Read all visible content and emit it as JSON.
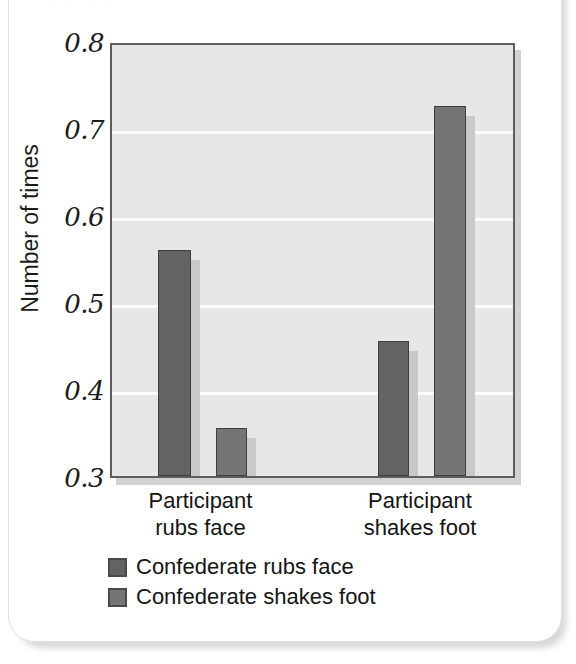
{
  "card": {
    "top_specks": "· · · ·"
  },
  "chart_data": {
    "type": "bar",
    "title": "",
    "subtitle": "",
    "xlabel": "",
    "ylabel": "Number of times",
    "ylim": [
      0.3,
      0.8
    ],
    "yticks": [
      "0.8",
      "0.7",
      "0.6",
      "0.5",
      "0.4",
      "0.3"
    ],
    "ytick_values": [
      0.8,
      0.7,
      0.6,
      0.5,
      0.4,
      0.3
    ],
    "grid": true,
    "grid_axis": "y",
    "legend_position": "bottom-left",
    "categories": [
      "Participant rubs face",
      "Participant shakes foot"
    ],
    "category_lines": [
      [
        "Participant",
        "rubs face"
      ],
      [
        "Participant",
        "shakes foot"
      ]
    ],
    "series": [
      {
        "name": "Confederate rubs face",
        "color": "#636363",
        "values": [
          0.56,
          0.455
        ]
      },
      {
        "name": "Confederate shakes foot",
        "color": "#757575",
        "values": [
          0.355,
          0.725
        ]
      }
    ],
    "bars": [
      {
        "series": "Confederate rubs face",
        "category": "Participant rubs face",
        "value": 0.56
      },
      {
        "series": "Confederate shakes foot",
        "category": "Participant rubs face",
        "value": 0.355
      },
      {
        "series": "Confederate rubs face",
        "category": "Participant shakes foot",
        "value": 0.455
      },
      {
        "series": "Confederate shakes foot",
        "category": "Participant shakes foot",
        "value": 0.725
      }
    ],
    "colors": {
      "plot_background": "#e7e7e7",
      "gridline": "#fbfbfb",
      "axis_border": "#5d5d5d",
      "bar_border": "#3e3e3e",
      "text": "#151515"
    }
  }
}
